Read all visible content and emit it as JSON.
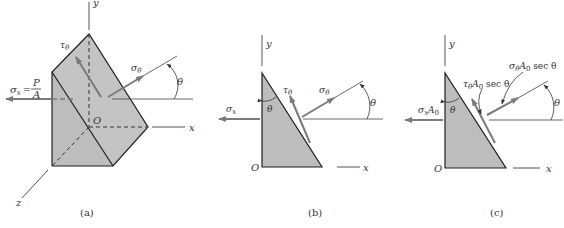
{
  "colors": {
    "background": "#ffffff",
    "fill": "#bdbdbd",
    "fill_light": "#c8c8c8",
    "stroke": "#1e1e1e",
    "arrow": "#7a7a7a",
    "axis": "#555555"
  },
  "figure_a": {
    "caption": "(a)",
    "axis_y": "y",
    "axis_x": "x",
    "axis_z": "z",
    "origin": "O",
    "sigma_x_lhs": "σ",
    "sigma_x_sub": "x",
    "sigma_x_eq": "=",
    "sigma_x_num": "P",
    "sigma_x_den": "A",
    "tau": "τ",
    "tau_sub": "θ",
    "sigma_theta": "σ",
    "sigma_theta_sub": "θ",
    "angle": "θ"
  },
  "figure_b": {
    "caption": "(b)",
    "axis_y": "y",
    "axis_x": "x",
    "origin": "O",
    "sigma_x": "σ",
    "sigma_x_sub": "x",
    "tau": "τ",
    "tau_sub": "θ",
    "sigma_theta": "σ",
    "sigma_theta_sub": "θ",
    "angle_inner": "θ",
    "angle": "θ"
  },
  "figure_c": {
    "caption": "(c)",
    "axis_y": "y",
    "axis_x": "x",
    "origin": "O",
    "sigma_x": "σ",
    "sigma_x_sub": "x",
    "sigma_x_area": "A",
    "sigma_x_area_sub": "0",
    "tau_label": "τ",
    "tau_sub": "θ",
    "tau_area": "A",
    "tau_area_sub": "0",
    "tau_sec": " sec θ",
    "sigma_label": "σ",
    "sigma_sub": "θ",
    "sigma_area": "A",
    "sigma_area_sub": "0",
    "sigma_sec": " sec θ",
    "angle_inner": "θ",
    "angle": "θ"
  }
}
